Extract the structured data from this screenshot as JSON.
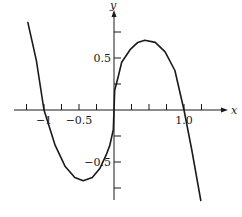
{
  "chart_data": {
    "type": "line",
    "title": "",
    "xlabel": "x",
    "ylabel": "y",
    "xlim": [
      -1.25,
      1.25
    ],
    "ylim": [
      -0.87,
      0.87
    ],
    "grid": false,
    "legend": null,
    "x_ticks": [
      -1.25,
      -1.0,
      -0.75,
      -0.5,
      -0.25,
      0.25,
      0.5,
      0.75,
      1.0,
      1.25
    ],
    "y_ticks": [
      -0.75,
      -0.5,
      -0.25,
      0.25,
      0.5,
      0.75
    ],
    "x_tick_labels": [
      {
        "value": -1.0,
        "text": "−1"
      },
      {
        "value": -0.5,
        "text": "−0.5"
      },
      {
        "value": 1.0,
        "text": "1.0"
      }
    ],
    "y_tick_labels": [
      {
        "value": 0.5,
        "text": "0.5"
      },
      {
        "value": -0.5,
        "text": "−0.5"
      }
    ],
    "series": [
      {
        "name": "f(x)",
        "x": [
          -1.23,
          -1.11,
          -1.0,
          -0.84,
          -0.7,
          -0.56,
          -0.44,
          -0.31,
          -0.2,
          -0.11,
          -0.06,
          -0.01,
          0.0,
          0.01,
          0.06,
          0.11,
          0.23,
          0.34,
          0.44,
          0.59,
          0.73,
          0.87,
          1.0,
          1.11,
          1.24
        ],
        "y": [
          0.84,
          0.48,
          0.0,
          -0.34,
          -0.54,
          -0.65,
          -0.68,
          -0.65,
          -0.56,
          -0.43,
          -0.34,
          -0.19,
          0.0,
          0.19,
          0.32,
          0.46,
          0.58,
          0.65,
          0.67,
          0.65,
          0.56,
          0.38,
          0.0,
          -0.38,
          -0.87
        ]
      }
    ]
  }
}
